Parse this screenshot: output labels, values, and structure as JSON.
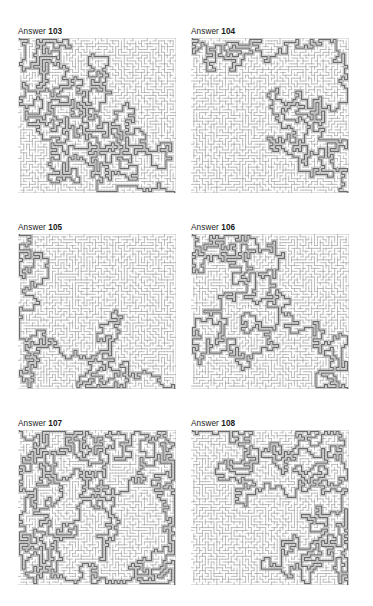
{
  "page": {
    "background_color": "#ffffff",
    "width": 373,
    "height": 606,
    "kind": "maze-answer-key-sheet",
    "columns": 2,
    "rows": 3
  },
  "style": {
    "wall_color": "#9a9a9a",
    "solution_color": "#6b6b6b",
    "border_color": "#8c8c8c",
    "label_color": "#1a1a1a"
  },
  "puzzles": [
    {
      "label_prefix": "Answer",
      "number": "103",
      "label": "Answer 103",
      "grid_cols": 55,
      "grid_rows": 54,
      "seed": 1031,
      "solution": {
        "entry": "top-left",
        "exit": "right-edge",
        "waypoints": [
          [
            1,
            0
          ],
          [
            1,
            4
          ],
          [
            3,
            7
          ],
          [
            2,
            12
          ],
          [
            5,
            16
          ],
          [
            4,
            21
          ],
          [
            6,
            24
          ],
          [
            9,
            26
          ],
          [
            12,
            28
          ],
          [
            14,
            31
          ],
          [
            17,
            33
          ],
          [
            16,
            36
          ],
          [
            19,
            38
          ],
          [
            22,
            36
          ],
          [
            25,
            33
          ],
          [
            23,
            29
          ],
          [
            26,
            26
          ],
          [
            30,
            24
          ],
          [
            33,
            22
          ],
          [
            36,
            24
          ],
          [
            39,
            21
          ],
          [
            42,
            18
          ],
          [
            45,
            21
          ],
          [
            47,
            25
          ],
          [
            46,
            30
          ],
          [
            49,
            33
          ],
          [
            52,
            36
          ],
          [
            54,
            38
          ]
        ]
      }
    },
    {
      "label_prefix": "Answer",
      "number": "104",
      "label": "Answer 104",
      "grid_cols": 55,
      "grid_rows": 54,
      "seed": 1041,
      "solution": {
        "entry": "top-left",
        "exit": "bottom-right",
        "waypoints": [
          [
            0,
            1
          ],
          [
            3,
            2
          ],
          [
            6,
            4
          ],
          [
            9,
            3
          ],
          [
            12,
            5
          ],
          [
            15,
            4
          ],
          [
            18,
            7
          ],
          [
            20,
            10
          ],
          [
            22,
            13
          ],
          [
            24,
            15
          ],
          [
            26,
            12
          ],
          [
            28,
            10
          ],
          [
            30,
            13
          ],
          [
            29,
            17
          ],
          [
            31,
            20
          ],
          [
            34,
            19
          ],
          [
            36,
            21
          ],
          [
            39,
            20
          ],
          [
            41,
            23
          ],
          [
            44,
            25
          ],
          [
            46,
            28
          ],
          [
            45,
            32
          ],
          [
            47,
            36
          ],
          [
            49,
            39
          ],
          [
            48,
            43
          ],
          [
            50,
            46
          ],
          [
            52,
            49
          ],
          [
            54,
            52
          ]
        ]
      }
    },
    {
      "label_prefix": "Answer",
      "number": "105",
      "label": "Answer 105",
      "grid_cols": 55,
      "grid_rows": 54,
      "seed": 1051,
      "solution": {
        "entry": "top-left",
        "exit": "bottom-right",
        "waypoints": [
          [
            1,
            0
          ],
          [
            3,
            3
          ],
          [
            5,
            1
          ],
          [
            8,
            4
          ],
          [
            11,
            2
          ],
          [
            14,
            5
          ],
          [
            17,
            3
          ],
          [
            20,
            5
          ],
          [
            23,
            2
          ],
          [
            26,
            4
          ],
          [
            28,
            7
          ],
          [
            30,
            10
          ],
          [
            32,
            13
          ],
          [
            34,
            16
          ],
          [
            36,
            19
          ],
          [
            38,
            22
          ],
          [
            36,
            25
          ],
          [
            34,
            28
          ],
          [
            32,
            30
          ],
          [
            30,
            32
          ],
          [
            32,
            35
          ],
          [
            34,
            38
          ],
          [
            36,
            41
          ],
          [
            38,
            44
          ],
          [
            40,
            47
          ],
          [
            42,
            50
          ],
          [
            44,
            53
          ]
        ]
      }
    },
    {
      "label_prefix": "Answer",
      "number": "106",
      "label": "Answer 106",
      "grid_cols": 55,
      "grid_rows": 54,
      "seed": 1061,
      "solution": {
        "entry": "top-left",
        "exit": "bottom-right",
        "waypoints": [
          [
            2,
            1
          ],
          [
            4,
            4
          ],
          [
            6,
            7
          ],
          [
            8,
            10
          ],
          [
            10,
            12
          ],
          [
            8,
            15
          ],
          [
            6,
            18
          ],
          [
            5,
            21
          ],
          [
            4,
            25
          ],
          [
            3,
            29
          ],
          [
            2,
            33
          ],
          [
            4,
            37
          ],
          [
            3,
            41
          ],
          [
            5,
            44
          ],
          [
            8,
            46
          ],
          [
            11,
            45
          ],
          [
            14,
            47
          ],
          [
            17,
            46
          ],
          [
            20,
            44
          ],
          [
            23,
            45
          ],
          [
            26,
            43
          ],
          [
            29,
            44
          ],
          [
            32,
            46
          ],
          [
            35,
            45
          ],
          [
            38,
            43
          ],
          [
            41,
            44
          ],
          [
            44,
            43
          ],
          [
            47,
            45
          ],
          [
            50,
            47
          ],
          [
            53,
            50
          ]
        ]
      }
    },
    {
      "label_prefix": "Answer",
      "number": "107",
      "label": "Answer 107",
      "grid_cols": 55,
      "grid_rows": 54,
      "seed": 1071,
      "solution": {
        "entry": "top-left",
        "exit": "bottom-right",
        "waypoints": [
          [
            2,
            0
          ],
          [
            4,
            3
          ],
          [
            6,
            6
          ],
          [
            8,
            4
          ],
          [
            10,
            7
          ],
          [
            9,
            11
          ],
          [
            11,
            14
          ],
          [
            13,
            17
          ],
          [
            15,
            20
          ],
          [
            17,
            23
          ],
          [
            19,
            26
          ],
          [
            21,
            24
          ],
          [
            24,
            26
          ],
          [
            26,
            29
          ],
          [
            24,
            32
          ],
          [
            22,
            35
          ],
          [
            21,
            39
          ],
          [
            23,
            42
          ],
          [
            26,
            45
          ],
          [
            29,
            47
          ],
          [
            32,
            46
          ],
          [
            35,
            48
          ],
          [
            38,
            47
          ],
          [
            41,
            45
          ],
          [
            44,
            43
          ],
          [
            46,
            46
          ],
          [
            48,
            49
          ],
          [
            51,
            51
          ],
          [
            54,
            53
          ]
        ]
      }
    },
    {
      "label_prefix": "Answer",
      "number": "108",
      "label": "Answer 108",
      "grid_cols": 55,
      "grid_rows": 54,
      "seed": 1081,
      "solution": {
        "entry": "top-left",
        "exit": "bottom-right",
        "waypoints": [
          [
            1,
            1
          ],
          [
            3,
            4
          ],
          [
            5,
            2
          ],
          [
            7,
            5
          ],
          [
            9,
            3
          ],
          [
            11,
            6
          ],
          [
            13,
            4
          ],
          [
            15,
            7
          ],
          [
            17,
            10
          ],
          [
            19,
            8
          ],
          [
            21,
            11
          ],
          [
            23,
            13
          ],
          [
            25,
            11
          ],
          [
            27,
            14
          ],
          [
            29,
            17
          ],
          [
            31,
            20
          ],
          [
            33,
            23
          ],
          [
            35,
            26
          ],
          [
            37,
            29
          ],
          [
            36,
            33
          ],
          [
            38,
            36
          ],
          [
            40,
            39
          ],
          [
            39,
            43
          ],
          [
            41,
            46
          ],
          [
            43,
            48
          ],
          [
            45,
            50
          ],
          [
            48,
            52
          ],
          [
            51,
            53
          ],
          [
            54,
            53
          ]
        ]
      }
    }
  ]
}
